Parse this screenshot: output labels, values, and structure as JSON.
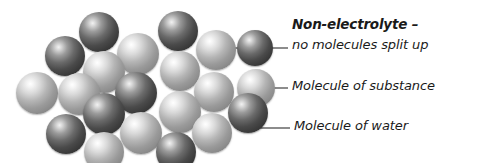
{
  "figure": {
    "title_label": "Non-electrolyte –",
    "background_color": "#ffffff",
    "width": 479,
    "height": 163
  },
  "legend": {
    "items": [
      {
        "id": "non-electrolyte",
        "label": "Non-electrolyte –",
        "bold": true
      },
      {
        "id": "no-split",
        "label": "no molecules split up",
        "bold": false
      },
      {
        "id": "molecule-substance",
        "label": "Molecule of substance",
        "bold": false
      },
      {
        "id": "molecule-water",
        "label": "Molecule of water",
        "bold": false
      }
    ]
  },
  "diagram_data": {
    "type": "molecular-cluster",
    "description": "Non-electrolyte solution: molecules of substance dispersed among water molecules with no dissociation into ions",
    "sphere_types": [
      {
        "name": "water",
        "label": "Molecule of water",
        "color": "#3a3a3a",
        "highlight": "#f2f2f2"
      },
      {
        "name": "substance",
        "label": "Molecule of substance",
        "color": "#9a9a9a",
        "highlight": "#ffffff"
      }
    ],
    "sphere_count": 21,
    "spheres": [
      {
        "cx": 99,
        "cy": 32,
        "r": 20,
        "type": "water"
      },
      {
        "cx": 178,
        "cy": 31,
        "r": 20,
        "type": "water"
      },
      {
        "cx": 65,
        "cy": 56,
        "r": 20,
        "type": "water"
      },
      {
        "cx": 138,
        "cy": 54,
        "r": 21,
        "type": "substance"
      },
      {
        "cx": 216,
        "cy": 50,
        "r": 20,
        "type": "substance"
      },
      {
        "cx": 255,
        "cy": 48,
        "r": 18,
        "type": "water"
      },
      {
        "cx": 104,
        "cy": 72,
        "r": 21,
        "type": "substance"
      },
      {
        "cx": 180,
        "cy": 71,
        "r": 20,
        "type": "substance"
      },
      {
        "cx": 37,
        "cy": 93,
        "r": 21,
        "type": "substance"
      },
      {
        "cx": 79,
        "cy": 94,
        "r": 21,
        "type": "substance"
      },
      {
        "cx": 136,
        "cy": 93,
        "r": 21,
        "type": "water"
      },
      {
        "cx": 214,
        "cy": 92,
        "r": 20,
        "type": "substance"
      },
      {
        "cx": 256,
        "cy": 88,
        "r": 19,
        "type": "substance"
      },
      {
        "cx": 104,
        "cy": 114,
        "r": 21,
        "type": "water"
      },
      {
        "cx": 180,
        "cy": 112,
        "r": 21,
        "type": "substance"
      },
      {
        "cx": 248,
        "cy": 113,
        "r": 20,
        "type": "water"
      },
      {
        "cx": 66,
        "cy": 134,
        "r": 20,
        "type": "water"
      },
      {
        "cx": 141,
        "cy": 133,
        "r": 21,
        "type": "substance"
      },
      {
        "cx": 212,
        "cy": 133,
        "r": 20,
        "type": "substance"
      },
      {
        "cx": 104,
        "cy": 152,
        "r": 20,
        "type": "substance"
      },
      {
        "cx": 176,
        "cy": 152,
        "r": 20,
        "type": "water"
      }
    ],
    "leader_lines": [
      {
        "id": "leader-no-split",
        "from": [
          234,
          48
        ],
        "to": [
          288,
          48
        ],
        "target": "cluster-edge"
      },
      {
        "id": "leader-substance",
        "from": [
          248,
          88
        ],
        "to": [
          288,
          88
        ],
        "target": "substance-sphere"
      },
      {
        "id": "leader-water",
        "from": [
          236,
          111
        ],
        "elbow": [
          236,
          128
        ],
        "to": [
          290,
          128
        ],
        "target": "water-sphere"
      }
    ],
    "line_color": "#1a1a1a"
  },
  "labels": {
    "title": {
      "text": "Non-electrolyte –",
      "x": 292,
      "y": 16
    },
    "subtitle": {
      "text": "no molecules split up",
      "x": 292,
      "y": 37
    },
    "substance": {
      "text": "Molecule of substance",
      "x": 292,
      "y": 78
    },
    "water": {
      "text": "Molecule of water",
      "x": 294,
      "y": 118
    }
  }
}
